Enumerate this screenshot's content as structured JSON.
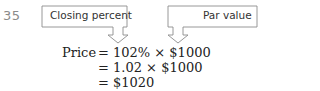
{
  "problem_number": "35",
  "callouts": {
    "left": "Closing percent",
    "right": "Par value"
  },
  "equations": [
    {
      "lhs": "Price",
      "rhs": "= 102% × $1000"
    },
    {
      "lhs": "",
      "rhs": "= 1.02 × $1000"
    },
    {
      "lhs": "",
      "rhs": "= $1020"
    }
  ],
  "colors": {
    "stroke": "#8c8c8c",
    "text": "#222222",
    "number": "#8a8a8a"
  }
}
